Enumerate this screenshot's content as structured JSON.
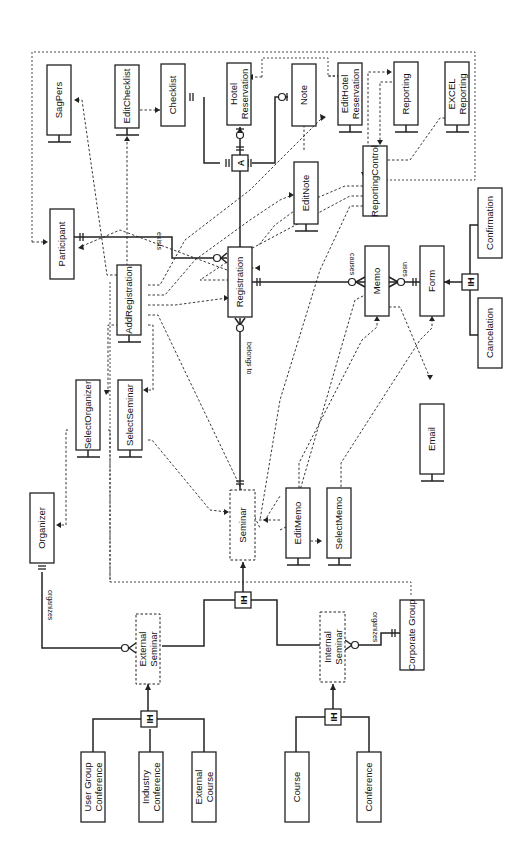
{
  "diagram": {
    "type": "entity-relationship / class diagram (rotated 90deg counter-clockwise)",
    "entities": {
      "sagpers": "SagPers",
      "editchecklist": "EditChecklist",
      "checklist": "Checklist",
      "hotel_reservation": [
        "Hotel",
        "Reservation"
      ],
      "note": "Note",
      "edithotel_reservation": [
        "EditHotel",
        "Reservation"
      ],
      "reporting": "Reporting",
      "excel_reporting": [
        "EXCEL",
        "Reporting"
      ],
      "participant": "Participant",
      "addregistration": "AddRegistration",
      "registration": "Registration",
      "editnote": "EditNote",
      "reportingcontrol": "ReportingControl",
      "memo": "Memo",
      "form": "Form",
      "confirmation": "Confirmation",
      "cancelation": "Cancelation",
      "selectorganizer": "SelectOrganizer",
      "selectseminar": "SelectSeminar",
      "email": "Email",
      "organizer": "Organizer",
      "seminar": "Seminar",
      "editmemo": "EditMemo",
      "selectmemo": "SelectMemo",
      "external_seminar": [
        "External",
        "Seminar"
      ],
      "internal_seminar": [
        "Internal",
        "Seminar"
      ],
      "corporate_group": "Corporate Group",
      "user_group_conference": [
        "User Group",
        "Conference"
      ],
      "industry_conference": [
        "Industry",
        "Conference"
      ],
      "external_course": [
        "External",
        "Course"
      ],
      "course": "Course",
      "conference": "Conference"
    },
    "relationships": {
      "exists": "exists",
      "causes": "causes",
      "uses": "uses",
      "belongs_to": "belongs to",
      "organizes_external": "organizes",
      "organizes_internal": "organizes"
    },
    "symbols": {
      "aggregation": "A",
      "inheritance": "IH"
    }
  }
}
